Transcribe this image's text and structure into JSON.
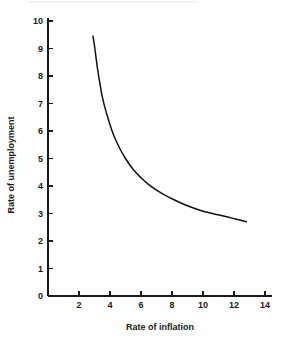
{
  "chart_data": {
    "type": "line",
    "title": "",
    "xlabel": "Rate of inflation",
    "ylabel": "Rate of unemployment",
    "xlim": [
      0,
      14.8
    ],
    "ylim": [
      0,
      10.2
    ],
    "xticks": [
      2,
      4,
      6,
      8,
      10,
      12,
      14
    ],
    "xtick_labels": [
      "2",
      "4",
      "6",
      "8",
      "10",
      "12",
      "14"
    ],
    "yticks": [
      0,
      1,
      2,
      3,
      4,
      5,
      6,
      7,
      8,
      9,
      10
    ],
    "ytick_labels": [
      "0",
      "1",
      "2",
      "3",
      "4",
      "5",
      "6",
      "7",
      "8",
      "9",
      "10"
    ],
    "grid": false,
    "legend": false,
    "legend_position": "none",
    "series": [
      {
        "name": "Phillips curve",
        "color": "#111111",
        "x": [
          2.9,
          3.0,
          3.2,
          3.5,
          3.8,
          4.2,
          4.6,
          5.0,
          5.5,
          6.0,
          6.5,
          7.0,
          7.6,
          8.2,
          9.0,
          9.8,
          10.6,
          11.4,
          12.1,
          12.8
        ],
        "y": [
          9.45,
          9.1,
          8.25,
          7.25,
          6.6,
          5.9,
          5.4,
          5.0,
          4.6,
          4.3,
          4.05,
          3.85,
          3.65,
          3.48,
          3.28,
          3.12,
          3.0,
          2.9,
          2.8,
          2.7
        ]
      }
    ],
    "annotations": []
  },
  "axes": {
    "x_axis_name": "x-axis",
    "y_axis_name": "y-axis"
  },
  "geometry": {
    "origin_x": 48,
    "origin_y": 296,
    "x_unit_px": 15.5,
    "y_unit_px": 27.5,
    "x_axis_end_px": 272,
    "y_axis_top_px": 18,
    "tick_len": 5
  }
}
